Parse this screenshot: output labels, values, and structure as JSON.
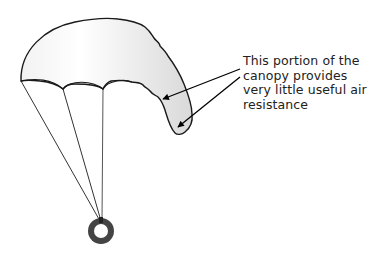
{
  "diagram": {
    "annotation": {
      "lines": [
        "This portion of the",
        "canopy provides",
        "very little useful air",
        "resistance"
      ]
    },
    "colors": {
      "outline": "#1a1a1a",
      "canopy_fill_light": "#ffffff",
      "canopy_fill_dark": "#dcdcdc",
      "suspension_line": "#333333",
      "ring": "#444444",
      "arrow": "#000000",
      "text": "#222222"
    },
    "counts": {
      "suspension_lines": 3,
      "annotation_arrows": 2
    }
  }
}
